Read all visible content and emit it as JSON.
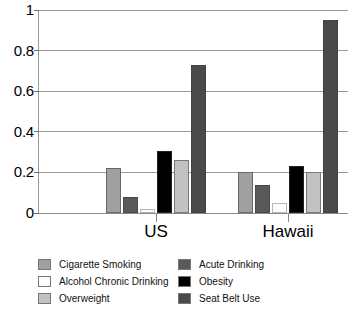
{
  "chart_data": {
    "type": "bar",
    "title": "",
    "xlabel": "",
    "ylabel": "",
    "categories": [
      "US",
      "Hawaii"
    ],
    "ylim": [
      0,
      1
    ],
    "yticks": [
      0,
      0.2,
      0.4,
      0.6,
      0.8,
      1
    ],
    "ytick_labels": [
      "0",
      "0.2",
      "0.4",
      "0.6",
      "0.8",
      "1"
    ],
    "grid": true,
    "legend_position": "bottom",
    "series": [
      {
        "name": "Cigarette Smoking",
        "color": "#a0a0a0",
        "values": [
          0.22,
          0.2
        ]
      },
      {
        "name": "Acute Drinking",
        "color": "#595959",
        "values": [
          0.08,
          0.14
        ]
      },
      {
        "name": "Alcohol Chronic Drinking",
        "color": "#fdfdfd",
        "values": [
          0.02,
          0.05
        ]
      },
      {
        "name": "Obesity",
        "color": "#000000",
        "values": [
          0.305,
          0.23
        ]
      },
      {
        "name": "Overweight",
        "color": "#c2c2c2",
        "values": [
          0.26,
          0.2
        ]
      },
      {
        "name": "Seat Belt Use",
        "color": "#4a4a4a",
        "values": [
          0.73,
          0.95
        ]
      }
    ]
  },
  "legend": {
    "left_column": [
      {
        "label": "Cigarette Smoking",
        "color": "#a0a0a0"
      },
      {
        "label": "Alcohol Chronic Drinking",
        "color": "#fdfdfd"
      },
      {
        "label": "Overweight",
        "color": "#c2c2c2"
      }
    ],
    "right_column": [
      {
        "label": "Acute Drinking",
        "color": "#595959"
      },
      {
        "label": "Obesity",
        "color": "#000000"
      },
      {
        "label": "Seat Belt Use",
        "color": "#4a4a4a"
      }
    ]
  },
  "axis": {
    "y_labels": [
      "1",
      "0.8",
      "0.6",
      "0.4",
      "0.2",
      "0"
    ],
    "x_labels": [
      "US",
      "Hawaii"
    ]
  }
}
